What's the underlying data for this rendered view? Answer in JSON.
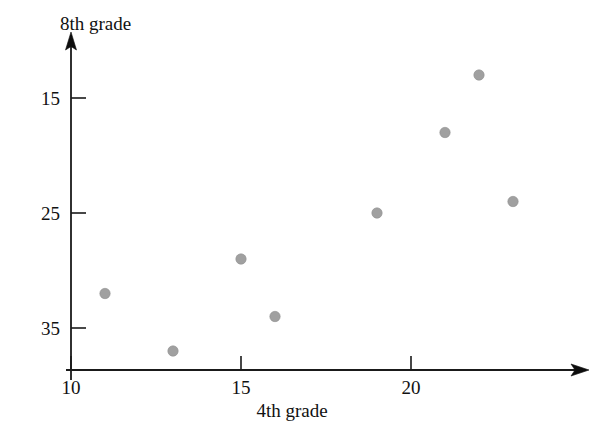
{
  "chart_data": {
    "type": "scatter",
    "title": "",
    "xlabel": "4th grade",
    "ylabel": "8th grade",
    "xlim": [
      9.1,
      25.2
    ],
    "ylim": [
      11.6,
      40.0
    ],
    "grid": false,
    "legend": null,
    "xticks": [
      10,
      15,
      20
    ],
    "xtick_labels": [
      "10",
      "15",
      "20"
    ],
    "yticks": [
      15,
      25,
      35
    ],
    "ytick_labels": [
      "15",
      "25",
      "35"
    ],
    "point_color": "#a0a0a0",
    "axis_color": "#111111",
    "points": [
      {
        "x": 11,
        "y": 18
      },
      {
        "x": 13,
        "y": 13
      },
      {
        "x": 15,
        "y": 21
      },
      {
        "x": 16,
        "y": 16
      },
      {
        "x": 19,
        "y": 25
      },
      {
        "x": 21,
        "y": 32
      },
      {
        "x": 22,
        "y": 37
      },
      {
        "x": 23,
        "y": 26
      }
    ],
    "x_values": [
      11,
      13,
      15,
      16,
      19,
      21,
      22,
      23
    ],
    "y_values": [
      18,
      13,
      21,
      16,
      25,
      32,
      37,
      26
    ]
  },
  "axes": {
    "y_axis_title": "8th grade",
    "x_axis_title": "4th grade",
    "x_tick_0": "10",
    "x_tick_1": "15",
    "x_tick_2": "20",
    "y_tick_0": "15",
    "y_tick_1": "25",
    "y_tick_2": "35"
  }
}
